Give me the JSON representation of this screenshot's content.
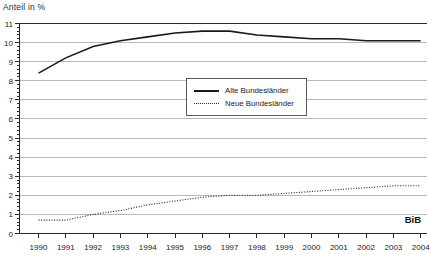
{
  "title": "Anteil in %",
  "source_label": "BiB",
  "colors": {
    "line_solid": "#1a1a1a",
    "line_dotted": "#222222",
    "grid": "#b8b8b8",
    "axis": "#2a2a2a",
    "text": "#222222"
  },
  "legend": {
    "items": [
      {
        "label": "Alte Bundesländer",
        "style": "solid"
      },
      {
        "label": "Neue Bundesländer",
        "style": "dotted"
      }
    ]
  },
  "chart_data": {
    "type": "line",
    "title": "Anteil in %",
    "xlabel": "",
    "ylabel": "",
    "x": [
      1990,
      1991,
      1992,
      1993,
      1994,
      1995,
      1996,
      1997,
      1998,
      1999,
      2000,
      2001,
      2002,
      2003,
      2004
    ],
    "series": [
      {
        "name": "Alte Bundesländer",
        "style": "solid",
        "values": [
          8.4,
          9.2,
          9.8,
          10.1,
          10.3,
          10.5,
          10.6,
          10.6,
          10.4,
          10.3,
          10.2,
          10.2,
          10.1,
          10.1,
          10.1
        ]
      },
      {
        "name": "Neue Bundesländer",
        "style": "dotted",
        "values": [
          0.7,
          0.7,
          1.0,
          1.2,
          1.5,
          1.7,
          1.9,
          2.0,
          2.0,
          2.1,
          2.2,
          2.3,
          2.4,
          2.5,
          2.5
        ]
      }
    ],
    "ylim": [
      0,
      11
    ],
    "yticks": [
      0,
      1,
      2,
      3,
      4,
      5,
      6,
      7,
      8,
      9,
      10,
      11
    ],
    "y_minor_step": 0.2,
    "grid": "horizontal",
    "legend_position": "inside-top-center",
    "annotation": "BiB"
  }
}
